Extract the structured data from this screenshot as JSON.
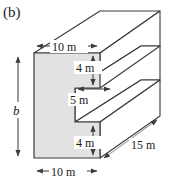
{
  "figure": {
    "panel_label": "(b)",
    "colors": {
      "face_fill": "#e2e2e2",
      "outline": "#3a3a3a",
      "dimension_line": "#3a3a3a",
      "background": "#ffffff",
      "text": "#1a1a1a"
    },
    "dimensions": [
      {
        "id": "top-width",
        "label": "10 m",
        "orientation": "horizontal",
        "location": "top flange width"
      },
      {
        "id": "upper-flange",
        "label": "4 m",
        "orientation": "vertical",
        "location": "upper flange thickness"
      },
      {
        "id": "notch-depth",
        "label": "5 m",
        "orientation": "horizontal",
        "location": "notch opening depth"
      },
      {
        "id": "lower-flange",
        "label": "4 m",
        "orientation": "vertical",
        "location": "lower flange thickness"
      },
      {
        "id": "bottom-width",
        "label": "10 m",
        "orientation": "horizontal",
        "location": "bottom flange width"
      },
      {
        "id": "depth",
        "label": "15 m",
        "orientation": "diagonal",
        "location": "prism length"
      },
      {
        "id": "height",
        "label": "b",
        "orientation": "vertical",
        "location": "overall section height"
      }
    ]
  }
}
